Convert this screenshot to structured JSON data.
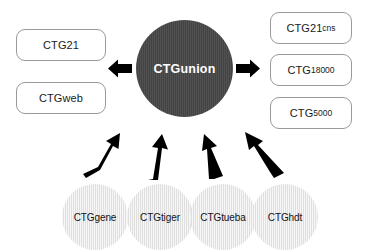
{
  "diagram": {
    "hub": {
      "label": "CTGunion",
      "color": "#474747",
      "text_color": "#ffffff"
    },
    "outputs_left": [
      {
        "name": "CTG21",
        "main": "CTG21",
        "sub": ""
      },
      {
        "name": "CTGweb",
        "main": "CTGweb",
        "sub": ""
      }
    ],
    "outputs_right": [
      {
        "name": "CTG21cns",
        "main": "CTG21",
        "sub": "cns"
      },
      {
        "name": "CTG18000",
        "main": "CTG",
        "sub": "18000"
      },
      {
        "name": "CTG5000",
        "main": "CTG",
        "sub": "5000"
      }
    ],
    "sources": [
      {
        "label": "CTGgene"
      },
      {
        "label": "CTGtiger"
      },
      {
        "label": "CTGtueba"
      },
      {
        "label": "CTGhdt"
      }
    ],
    "arrows": {
      "left_arrow": "arrow-left",
      "right_arrow": "arrow-right",
      "source_arrows": [
        "arrow-up-from-ctggene",
        "arrow-up-from-ctgtiger",
        "arrow-up-from-ctgtueba",
        "arrow-up-from-ctghdt"
      ],
      "color": "#000000"
    },
    "colors": {
      "background": "#ffffff",
      "box_border": "#9a9a9a",
      "source_fill": "#e7e7e7",
      "hub_fill": "#474747"
    }
  }
}
